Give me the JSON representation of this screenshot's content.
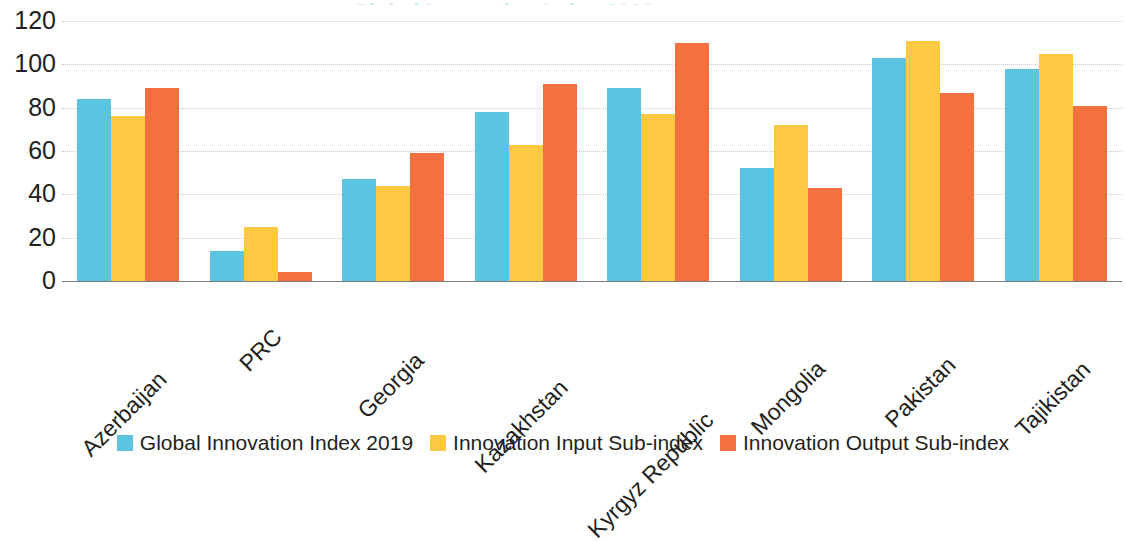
{
  "chart_data": {
    "type": "bar",
    "title": "Global Innovation Index 2019",
    "xlabel": "",
    "ylabel": "",
    "ylim": [
      0,
      120
    ],
    "ytick_step": 20,
    "yticks": [
      "120",
      "100",
      "80",
      "60",
      "40",
      "20",
      "0"
    ],
    "grid": true,
    "legend_position": "bottom",
    "categories": [
      "Azerbaijan",
      "PRC",
      "Georgia",
      "Kazakhstan",
      "Kyrgyz Republic",
      "Mongolia",
      "Pakistan",
      "Tajikistan"
    ],
    "series": [
      {
        "name": "Global Innovation Index 2019",
        "color": "#5cc3e0",
        "values": [
          84,
          14,
          47,
          78,
          89,
          52,
          103,
          98
        ]
      },
      {
        "name": "Innovation Input Sub-index",
        "color": "#fdc943",
        "values": [
          76,
          25,
          44,
          63,
          77,
          72,
          111,
          105
        ]
      },
      {
        "name": "Innovation Output Sub-index",
        "color": "#f4703f",
        "values": [
          89,
          4,
          59,
          91,
          110,
          43,
          87,
          81
        ]
      }
    ]
  },
  "colors": {
    "series_0": "#5cc3e0",
    "series_1": "#fdc943",
    "series_2": "#f4703f",
    "gridline": "#c9c9c9",
    "axis": "#7b7b7b",
    "text": "#231f20",
    "background": "#ffffff"
  }
}
